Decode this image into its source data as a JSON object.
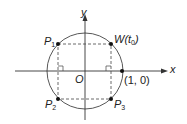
{
  "diagram": {
    "type": "unit-circle",
    "axes": {
      "x_label": "x",
      "y_label": "y",
      "origin_label": "O"
    },
    "points": [
      {
        "name": "P1",
        "base": "P",
        "sub": "1",
        "x": 58,
        "y": 44
      },
      {
        "name": "W(t0)",
        "base": "W(t",
        "sub": "0",
        "tail": ")",
        "x": 111,
        "y": 44
      },
      {
        "name": "P2",
        "base": "P",
        "sub": "2",
        "x": 58,
        "y": 99
      },
      {
        "name": "P3",
        "base": "P",
        "sub": "3",
        "x": 111,
        "y": 99
      },
      {
        "name": "(1, 0)",
        "label": "(1, 0)",
        "x": 122,
        "y": 71
      }
    ],
    "colors": {
      "stroke": "#333333",
      "point": "#111111"
    }
  }
}
